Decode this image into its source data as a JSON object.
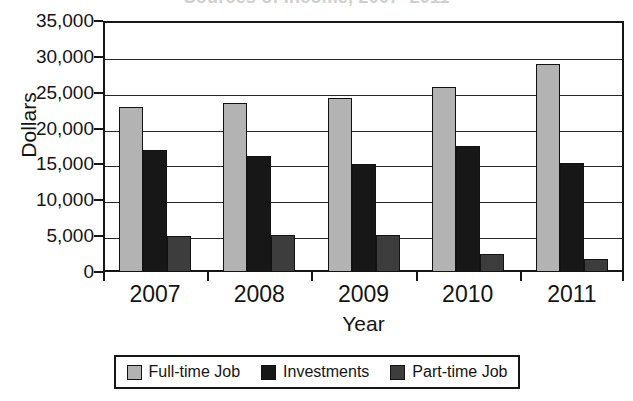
{
  "chart_data": {
    "type": "bar",
    "title": "Sources of Income, 2007–2011",
    "xlabel": "Year",
    "ylabel": "Dollars",
    "categories": [
      "2007",
      "2008",
      "2009",
      "2010",
      "2011"
    ],
    "series": [
      {
        "name": "Full-time Job",
        "color": "#b3b3b3",
        "values": [
          23000,
          23500,
          24200,
          25800,
          29000
        ]
      },
      {
        "name": "Investments",
        "color": "#171717",
        "values": [
          17000,
          16200,
          15100,
          17600,
          15200
        ]
      },
      {
        "name": "Part-time Job",
        "color": "#3d3d3d",
        "values": [
          5000,
          5100,
          5100,
          2500,
          1800
        ]
      }
    ],
    "ylim": [
      0,
      35000
    ],
    "y_ticks": [
      "35,000",
      "30,000",
      "25,000",
      "20,000",
      "15,000",
      "10,000",
      "5,000",
      "0"
    ],
    "y_tick_values": [
      35000,
      30000,
      25000,
      20000,
      15000,
      10000,
      5000,
      0
    ],
    "grid": true,
    "legend_position": "bottom"
  },
  "legend": {
    "items": [
      {
        "label": "Full-time Job",
        "color": "#b3b3b3"
      },
      {
        "label": "Investments",
        "color": "#171717"
      },
      {
        "label": "Part-time Job",
        "color": "#3d3d3d"
      }
    ]
  }
}
